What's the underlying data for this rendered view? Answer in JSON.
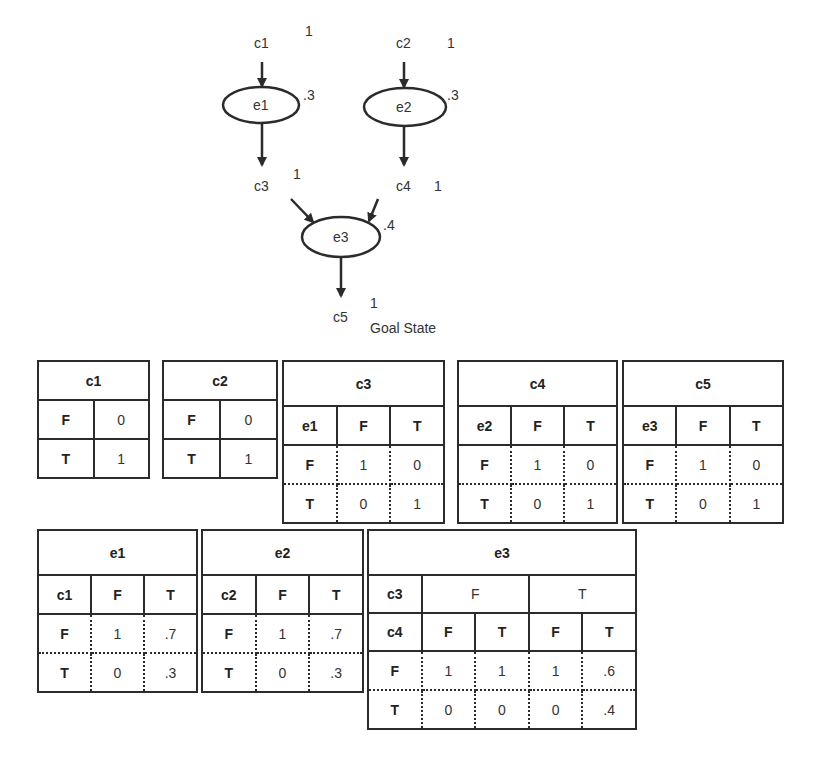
{
  "diagram": {
    "nodes": [
      {
        "id": "c1",
        "label": "c1",
        "prob": "1"
      },
      {
        "id": "c2",
        "label": "c2",
        "prob": "1"
      },
      {
        "id": "e1",
        "label": "e1",
        "prob": ".3"
      },
      {
        "id": "e2",
        "label": "e2",
        "prob": ".3"
      },
      {
        "id": "c3",
        "label": "c3",
        "prob": "1"
      },
      {
        "id": "c4",
        "label": "c4",
        "prob": "1"
      },
      {
        "id": "e3",
        "label": "e3",
        "prob": ".4"
      },
      {
        "id": "c5",
        "label": "c5",
        "prob": "1"
      }
    ],
    "edges": [
      [
        "c1",
        "e1"
      ],
      [
        "e1",
        "c3"
      ],
      [
        "c2",
        "e2"
      ],
      [
        "e2",
        "c4"
      ],
      [
        "c3",
        "e3"
      ],
      [
        "c4",
        "e3"
      ],
      [
        "e3",
        "c5"
      ]
    ],
    "goal_label": "Goal State",
    "line_color": "#2b2b2b"
  },
  "tables": {
    "c1": {
      "title": "c1",
      "rows": [
        [
          "F",
          "0"
        ],
        [
          "T",
          "1"
        ]
      ]
    },
    "c2": {
      "title": "c2",
      "rows": [
        [
          "F",
          "0"
        ],
        [
          "T",
          "1"
        ]
      ]
    },
    "c3": {
      "title": "c3",
      "parent": "e1",
      "cols": [
        "F",
        "T"
      ],
      "rows": [
        [
          "F",
          "1",
          "0"
        ],
        [
          "T",
          "0",
          "1"
        ]
      ]
    },
    "c4": {
      "title": "c4",
      "parent": "e2",
      "cols": [
        "F",
        "T"
      ],
      "rows": [
        [
          "F",
          "1",
          "0"
        ],
        [
          "T",
          "0",
          "1"
        ]
      ]
    },
    "c5": {
      "title": "c5",
      "parent": "e3",
      "cols": [
        "F",
        "T"
      ],
      "rows": [
        [
          "F",
          "1",
          "0"
        ],
        [
          "T",
          "0",
          "1"
        ]
      ]
    },
    "e1": {
      "title": "e1",
      "parent": "c1",
      "cols": [
        "F",
        "T"
      ],
      "rows": [
        [
          "F",
          "1",
          ".7"
        ],
        [
          "T",
          "0",
          ".3"
        ]
      ]
    },
    "e2": {
      "title": "e2",
      "parent": "c2",
      "cols": [
        "F",
        "T"
      ],
      "rows": [
        [
          "F",
          "1",
          ".7"
        ],
        [
          "T",
          "0",
          ".3"
        ]
      ]
    },
    "e3": {
      "title": "e3",
      "parent1": "c3",
      "parent2": "c4",
      "parent1_vals": [
        "F",
        "T"
      ],
      "parent2_vals": [
        "F",
        "T",
        "F",
        "T"
      ],
      "rows": [
        [
          "F",
          "1",
          "1",
          "1",
          ".6"
        ],
        [
          "T",
          "0",
          "0",
          "0",
          ".4"
        ]
      ]
    }
  }
}
